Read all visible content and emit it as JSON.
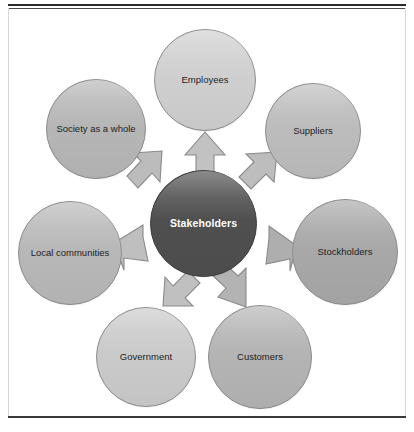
{
  "figure": {
    "name": "stakeholders-hub-and-spoke-diagram",
    "center": {
      "id": "stakeholders",
      "label": "Stakeholders",
      "color": "#4f4f4f",
      "text_color": "#ffffff"
    },
    "spokes": [
      {
        "id": "employees",
        "label": "Employees",
        "color": "#cfcfcf",
        "position": "top",
        "cx": 205,
        "cy": 80,
        "r": 51
      },
      {
        "id": "suppliers",
        "label": "Suppliers",
        "color": "#bcbcbc",
        "position": "top-right",
        "cx": 313,
        "cy": 131,
        "r": 48
      },
      {
        "id": "stockholders",
        "label": "Stockholders",
        "color": "#a8a8a8",
        "position": "right",
        "cx": 345,
        "cy": 252,
        "r": 53
      },
      {
        "id": "customers",
        "label": "Customers",
        "color": "#b4b4b4",
        "position": "bottom-right",
        "cx": 260,
        "cy": 357,
        "r": 52
      },
      {
        "id": "government",
        "label": "Government",
        "color": "#cacaca",
        "position": "bottom-left",
        "cx": 146,
        "cy": 357,
        "r": 50
      },
      {
        "id": "local-communities",
        "label": "Local communities",
        "color": "#b8b8b8",
        "position": "left",
        "cx": 70,
        "cy": 253,
        "r": 52
      },
      {
        "id": "society",
        "label": "Society as a whole",
        "color": "#b6b6b6",
        "position": "top-left",
        "cx": 96,
        "cy": 129,
        "r": 50
      }
    ],
    "arrows": [
      {
        "id": "arrow-to-employees",
        "target": "employees",
        "direction": "up",
        "color": "#c2c2c2"
      },
      {
        "id": "arrow-to-suppliers",
        "target": "suppliers",
        "direction": "up-right",
        "color": "#bdbdbd"
      },
      {
        "id": "arrow-to-stockholders",
        "target": "stockholders",
        "direction": "right",
        "color": "#aeaeae"
      },
      {
        "id": "arrow-to-customers",
        "target": "customers",
        "direction": "down-right",
        "color": "#b3b3b3"
      },
      {
        "id": "arrow-to-government",
        "target": "government",
        "direction": "down-left",
        "color": "#c0c0c0"
      },
      {
        "id": "arrow-to-local-communities",
        "target": "local-communities",
        "direction": "left",
        "color": "#bfbfbf"
      },
      {
        "id": "arrow-to-society",
        "target": "society",
        "direction": "up-left",
        "color": "#bcbcbc"
      }
    ]
  },
  "chart_data": {
    "type": "diagram",
    "subtype": "hub-and-spoke",
    "title": "Stakeholders",
    "hub": "Stakeholders",
    "nodes": [
      "Employees",
      "Suppliers",
      "Stockholders",
      "Customers",
      "Government",
      "Local communities",
      "Society as a whole"
    ],
    "edges": [
      {
        "from": "Stakeholders",
        "to": "Employees"
      },
      {
        "from": "Stakeholders",
        "to": "Suppliers"
      },
      {
        "from": "Stakeholders",
        "to": "Stockholders"
      },
      {
        "from": "Stakeholders",
        "to": "Customers"
      },
      {
        "from": "Stakeholders",
        "to": "Government"
      },
      {
        "from": "Stakeholders",
        "to": "Local communities"
      },
      {
        "from": "Stakeholders",
        "to": "Society as a whole"
      }
    ],
    "edge_style": "block-arrow",
    "node_shape": "circle",
    "legend": []
  }
}
